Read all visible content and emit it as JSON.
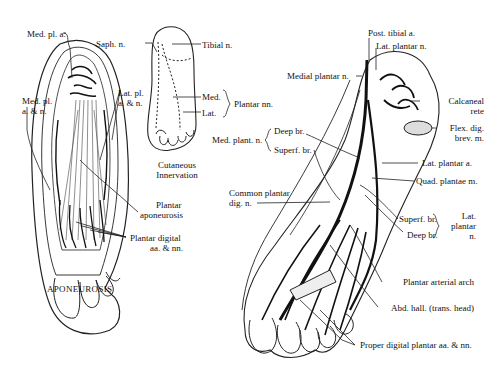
{
  "figure": {
    "panels": {
      "aponeurosis": {
        "title": "APONEUROSIS",
        "labels": {
          "med_pl_a": "Med. pl. a.",
          "med_pl_an_1": "Med. pl.",
          "med_pl_an_2": "a. & n.",
          "lat_pl_an_1": "Lat. pl.",
          "lat_pl_an_2": "a. & n.",
          "plantar_apon_1": "Plantar",
          "plantar_apon_2": "aponeurosis",
          "plantar_digital_1": "Plantar digital",
          "plantar_digital_2": "aa. & nn."
        }
      },
      "cutaneous": {
        "title_1": "Cutaneous",
        "title_2": "Innervation",
        "labels": {
          "saph": "Saph. n.",
          "tibial": "Tibial n.",
          "med": "Med.",
          "lat": "Lat.",
          "plantar_nn": "Plantar nn."
        }
      },
      "deep_dissection": {
        "labels": {
          "post_tibial_a": "Post. tibial a.",
          "lat_plantar_n": "Lat. plantar n.",
          "medial_plantar_n": "Medial plantar n.",
          "calcaneal_rete_1": "Calcaneal",
          "calcaneal_rete_2": "rete",
          "flex_dig_1": "Flex. dig.",
          "flex_dig_2": "brev. m.",
          "med_plant_n": "Med. plant. n.",
          "deep_br": "Deep br.",
          "superf_br": "Superf. br.",
          "lat_plantar_a": "Lat. plantar a.",
          "quad_plantae": "Quad. plantae m.",
          "common_plantar_1": "Common plantar",
          "common_plantar_2": "dig. n.",
          "lat_superf_br": "Superf. br.",
          "lat_deep_br": "Deep br.",
          "lat_plantar_group_1": "Lat.",
          "lat_plantar_group_2": "plantar",
          "lat_plantar_group_3": "n.",
          "plantar_arterial_arch": "Plantar arterial arch",
          "abd_hall": "Abd. hall. (trans. head)",
          "proper_digital": "Proper digital plantar aa. & nn."
        }
      }
    }
  }
}
